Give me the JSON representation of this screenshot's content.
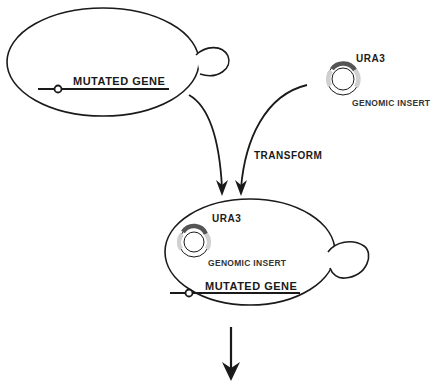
{
  "diagram": {
    "type": "yeast transformation schematic",
    "nodes": {
      "mutant_cell": {
        "gene_label": "MUTATED GENE"
      },
      "plasmid": {
        "marker_label": "URA3",
        "insert_label": "GENOMIC INSERT"
      },
      "transformed_cell": {
        "marker_label": "URA3",
        "insert_label": "GENOMIC INSERT",
        "gene_label": "MUTATED GENE"
      }
    },
    "edges": [
      {
        "from": "mutant_cell",
        "to": "transformed_cell",
        "label": ""
      },
      {
        "from": "plasmid",
        "to": "transformed_cell",
        "label": "TRANSFORM"
      },
      {
        "from": "transformed_cell",
        "to": "next_step",
        "label": ""
      }
    ]
  },
  "colors": {
    "line": "#1a1a1a",
    "plasmid_dark": "#555555",
    "plasmid_light": "#d0d0d0",
    "background": "#ffffff"
  }
}
